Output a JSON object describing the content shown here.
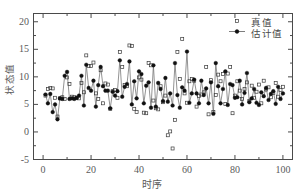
{
  "chart_data": {
    "type": "scatter",
    "title": "",
    "xlabel": "时序",
    "ylabel": "状态值",
    "xlim": [
      -4,
      104
    ],
    "ylim": [
      -5,
      21.5
    ],
    "xticks": [
      0,
      20,
      40,
      60,
      80,
      100
    ],
    "yticks": [
      -5,
      0,
      5,
      10,
      15,
      20
    ],
    "xtick_labels": [
      "0",
      "20",
      "40",
      "60",
      "80",
      "100"
    ],
    "ytick_labels": [
      "-5",
      "0",
      "5",
      "10",
      "15",
      "20"
    ],
    "x_minor_tick_step": 10,
    "y_minor_tick_step": 2.5,
    "grid": false,
    "legend_position": "top-right",
    "frame": true,
    "x": [
      1,
      2,
      3,
      4,
      5,
      6,
      7,
      8,
      9,
      10,
      11,
      12,
      13,
      14,
      15,
      16,
      17,
      18,
      19,
      20,
      21,
      22,
      23,
      24,
      25,
      26,
      27,
      28,
      29,
      30,
      31,
      32,
      33,
      34,
      35,
      36,
      37,
      38,
      39,
      40,
      41,
      42,
      43,
      44,
      45,
      46,
      47,
      48,
      49,
      50,
      51,
      52,
      53,
      54,
      55,
      56,
      57,
      58,
      59,
      60,
      61,
      62,
      63,
      64,
      65,
      66,
      67,
      68,
      69,
      70,
      71,
      72,
      73,
      74,
      75,
      76,
      77,
      78,
      79,
      80,
      81,
      82,
      83,
      84,
      85,
      86,
      87,
      88,
      89,
      90,
      91,
      92,
      93,
      94,
      95,
      96,
      97,
      98,
      99,
      100
    ],
    "series": [
      {
        "name": "真值",
        "marker": "open-square",
        "color": "#3a3a3a",
        "line": false,
        "values": [
          6.6,
          7.8,
          8.0,
          7.9,
          6.2,
          2.8,
          6.1,
          6.3,
          6.0,
          9.9,
          8.7,
          6.4,
          6.3,
          6.2,
          6.1,
          8.9,
          7.2,
          13.9,
          12.0,
          12.0,
          12.6,
          7.0,
          6.0,
          11.2,
          5.2,
          8.8,
          8.6,
          4.2,
          7.4,
          7.6,
          6.2,
          14.5,
          11.8,
          8.5,
          8.3,
          15.7,
          15.6,
          4.2,
          3.6,
          9.9,
          9.5,
          3.5,
          3.4,
          12.5,
          12.1,
          5.7,
          4.3,
          4.1,
          8.3,
          5.4,
          6.6,
          -0.6,
          0.1,
          -3.0,
          2.2,
          14.5,
          9.6,
          16.9,
          7.0,
          5.3,
          9.2,
          9.6,
          9.3,
          4.6,
          6.5,
          6.8,
          7.2,
          11.8,
          3.2,
          9.4,
          3.6,
          6.7,
          10.4,
          9.2,
          10.5,
          5.1,
          10.6,
          11.8,
          3.4,
          6.6,
          9.2,
          7.5,
          6.0,
          7.8,
          9.0,
          5.6,
          8.4,
          6.2,
          7.3,
          8.6,
          5.2,
          9.3,
          7.7,
          8.1,
          6.3,
          7.1,
          8.9,
          6.4,
          7.6,
          8.2
        ]
      },
      {
        "name": "估计值",
        "marker": "filled-circle",
        "color": "#111111",
        "line": true,
        "values": [
          6.8,
          5.2,
          6.9,
          3.6,
          5.0,
          2.3,
          6.1,
          6.0,
          10.2,
          10.9,
          6.0,
          6.1,
          6.0,
          6.2,
          6.6,
          10.2,
          4.8,
          12.2,
          8.0,
          7.5,
          9.3,
          4.6,
          8.5,
          11.8,
          8.3,
          7.5,
          7.5,
          4.3,
          7.3,
          6.6,
          7.4,
          13.0,
          6.4,
          8.2,
          8.7,
          12.8,
          5.0,
          9.2,
          6.1,
          11.0,
          10.5,
          5.2,
          8.4,
          9.0,
          4.4,
          12.1,
          4.6,
          8.9,
          7.8,
          5.6,
          9.8,
          5.5,
          7.0,
          4.8,
          12.5,
          6.7,
          4.4,
          8.1,
          7.5,
          14.6,
          5.3,
          7.0,
          9.5,
          7.0,
          5.2,
          9.3,
          6.7,
          7.9,
          5.2,
          9.0,
          3.3,
          12.5,
          8.3,
          5.2,
          7.8,
          11.0,
          4.9,
          8.7,
          8.5,
          6.2,
          6.3,
          9.3,
          5.0,
          7.1,
          10.7,
          5.4,
          6.1,
          7.8,
          5.3,
          4.9,
          7.2,
          6.5,
          8.0,
          5.8,
          6.9,
          7.4,
          5.1,
          8.2,
          6.0,
          7.0
        ]
      }
    ]
  },
  "legend": {
    "entries": [
      {
        "label": "真值"
      },
      {
        "label": "估计值"
      }
    ]
  },
  "colors": {
    "axis": "#4a4a4a",
    "true_marker": "#3a3a3a",
    "est_marker": "#111111",
    "est_line": "#6f6f6f",
    "background": "#ffffff"
  }
}
